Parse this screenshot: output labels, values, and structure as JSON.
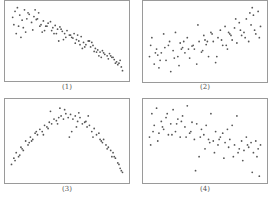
{
  "chart_data": [
    {
      "type": "scatter",
      "title": "(1)",
      "description": "Negative linear-ish correlation, points from top-left to bottom-right",
      "x": [
        0.04,
        0.06,
        0.08,
        0.1,
        0.12,
        0.14,
        0.16,
        0.18,
        0.2,
        0.22,
        0.24,
        0.26,
        0.28,
        0.3,
        0.32,
        0.34,
        0.36,
        0.38,
        0.4,
        0.42,
        0.44,
        0.46,
        0.48,
        0.5,
        0.52,
        0.54,
        0.56,
        0.58,
        0.6,
        0.62,
        0.64,
        0.66,
        0.68,
        0.7,
        0.72,
        0.74,
        0.76,
        0.78,
        0.8,
        0.82,
        0.84,
        0.86,
        0.88,
        0.9,
        0.92,
        0.94,
        0.96,
        0.05,
        0.09,
        0.13,
        0.17,
        0.21,
        0.25,
        0.29,
        0.33,
        0.37,
        0.41,
        0.45,
        0.49,
        0.53,
        0.57,
        0.61,
        0.65,
        0.69,
        0.73,
        0.77,
        0.81,
        0.85,
        0.89,
        0.93,
        0.97,
        0.07,
        0.15,
        0.23,
        0.31,
        0.39,
        0.47,
        0.55,
        0.63,
        0.71,
        0.79,
        0.87,
        0.95,
        0.11,
        0.27,
        0.43,
        0.59,
        0.75,
        0.91
      ],
      "y": [
        0.82,
        0.9,
        0.95,
        0.85,
        0.78,
        0.92,
        0.8,
        0.86,
        0.75,
        0.83,
        0.79,
        0.88,
        0.72,
        0.77,
        0.7,
        0.74,
        0.76,
        0.68,
        0.71,
        0.66,
        0.69,
        0.63,
        0.6,
        0.64,
        0.58,
        0.55,
        0.6,
        0.52,
        0.5,
        0.56,
        0.48,
        0.45,
        0.5,
        0.42,
        0.44,
        0.4,
        0.38,
        0.35,
        0.37,
        0.32,
        0.3,
        0.33,
        0.28,
        0.25,
        0.22,
        0.2,
        0.15,
        0.72,
        0.7,
        0.68,
        0.88,
        0.65,
        0.8,
        0.62,
        0.7,
        0.64,
        0.6,
        0.66,
        0.55,
        0.58,
        0.47,
        0.45,
        0.42,
        0.5,
        0.36,
        0.3,
        0.34,
        0.26,
        0.28,
        0.18,
        0.1,
        0.6,
        0.62,
        0.92,
        0.64,
        0.6,
        0.52,
        0.54,
        0.4,
        0.48,
        0.28,
        0.3,
        0.24,
        0.55,
        0.7,
        0.5,
        0.58,
        0.35,
        0.2
      ],
      "xlim": [
        0,
        1
      ],
      "ylim": [
        0,
        1
      ],
      "grid": false
    },
    {
      "type": "scatter",
      "title": "(2)",
      "description": "Weak positive correlation, widely scattered",
      "x": [
        0.03,
        0.05,
        0.07,
        0.09,
        0.11,
        0.13,
        0.15,
        0.17,
        0.19,
        0.21,
        0.23,
        0.25,
        0.27,
        0.29,
        0.31,
        0.33,
        0.35,
        0.37,
        0.39,
        0.41,
        0.43,
        0.45,
        0.47,
        0.49,
        0.51,
        0.53,
        0.55,
        0.57,
        0.59,
        0.61,
        0.63,
        0.65,
        0.67,
        0.69,
        0.71,
        0.73,
        0.75,
        0.77,
        0.79,
        0.81,
        0.83,
        0.85,
        0.87,
        0.89,
        0.91,
        0.93,
        0.95,
        0.97,
        0.04,
        0.12,
        0.2,
        0.28,
        0.36,
        0.44,
        0.52,
        0.6,
        0.68,
        0.76,
        0.84,
        0.92,
        0.08,
        0.16,
        0.24,
        0.32,
        0.4,
        0.48,
        0.56,
        0.64,
        0.72,
        0.8,
        0.88,
        0.96,
        0.1,
        0.3,
        0.5,
        0.7,
        0.9
      ],
      "y": [
        0.3,
        0.55,
        0.2,
        0.4,
        0.15,
        0.35,
        0.6,
        0.25,
        0.45,
        0.1,
        0.38,
        0.62,
        0.3,
        0.48,
        0.42,
        0.35,
        0.55,
        0.28,
        0.44,
        0.4,
        0.2,
        0.5,
        0.36,
        0.58,
        0.46,
        0.3,
        0.62,
        0.5,
        0.22,
        0.55,
        0.65,
        0.45,
        0.7,
        0.4,
        0.6,
        0.52,
        0.68,
        0.48,
        0.75,
        0.58,
        0.62,
        0.8,
        0.5,
        0.72,
        0.85,
        0.6,
        0.9,
        0.7,
        0.45,
        0.25,
        0.5,
        0.18,
        0.4,
        0.72,
        0.5,
        0.3,
        0.45,
        0.8,
        0.55,
        0.65,
        0.35,
        0.42,
        0.28,
        0.5,
        0.45,
        0.38,
        0.6,
        0.52,
        0.58,
        0.65,
        0.88,
        0.55,
        0.32,
        0.4,
        0.52,
        0.62,
        0.95
      ],
      "xlim": [
        0,
        1
      ],
      "ylim": [
        0,
        1
      ],
      "grid": false
    },
    {
      "type": "scatter",
      "title": "(3)",
      "description": "Inverted-U (quadratic) relationship",
      "x": [
        0.03,
        0.05,
        0.07,
        0.09,
        0.11,
        0.13,
        0.15,
        0.17,
        0.19,
        0.21,
        0.23,
        0.25,
        0.27,
        0.29,
        0.31,
        0.33,
        0.35,
        0.37,
        0.39,
        0.41,
        0.43,
        0.45,
        0.47,
        0.49,
        0.51,
        0.53,
        0.55,
        0.57,
        0.59,
        0.61,
        0.63,
        0.65,
        0.67,
        0.69,
        0.71,
        0.73,
        0.75,
        0.77,
        0.79,
        0.81,
        0.83,
        0.85,
        0.87,
        0.89,
        0.91,
        0.93,
        0.95,
        0.97,
        0.06,
        0.12,
        0.18,
        0.24,
        0.3,
        0.36,
        0.42,
        0.48,
        0.54,
        0.6,
        0.66,
        0.72,
        0.78,
        0.84,
        0.9,
        0.96,
        0.1,
        0.2,
        0.34,
        0.44,
        0.52,
        0.58,
        0.68,
        0.8,
        0.88,
        0.94
      ],
      "y": [
        0.2,
        0.28,
        0.35,
        0.3,
        0.42,
        0.38,
        0.5,
        0.45,
        0.55,
        0.52,
        0.6,
        0.58,
        0.65,
        0.62,
        0.7,
        0.68,
        0.74,
        0.72,
        0.78,
        0.76,
        0.8,
        0.82,
        0.78,
        0.85,
        0.8,
        0.84,
        0.78,
        0.82,
        0.75,
        0.8,
        0.72,
        0.74,
        0.68,
        0.7,
        0.62,
        0.66,
        0.58,
        0.6,
        0.5,
        0.52,
        0.45,
        0.42,
        0.38,
        0.35,
        0.28,
        0.22,
        0.15,
        0.1,
        0.25,
        0.4,
        0.48,
        0.62,
        0.58,
        0.88,
        0.72,
        0.9,
        0.62,
        0.86,
        0.75,
        0.55,
        0.52,
        0.4,
        0.3,
        0.12,
        0.32,
        0.5,
        0.66,
        0.92,
        0.55,
        0.68,
        0.82,
        0.48,
        0.3,
        0.2
      ],
      "xlim": [
        0,
        1
      ],
      "ylim": [
        0,
        1
      ],
      "grid": false
    },
    {
      "type": "scatter",
      "title": "(4)",
      "description": "Weak negative correlation, widely scattered",
      "x": [
        0.03,
        0.05,
        0.07,
        0.09,
        0.11,
        0.13,
        0.15,
        0.17,
        0.19,
        0.21,
        0.23,
        0.25,
        0.27,
        0.29,
        0.31,
        0.33,
        0.35,
        0.37,
        0.39,
        0.41,
        0.43,
        0.45,
        0.47,
        0.49,
        0.51,
        0.53,
        0.55,
        0.57,
        0.59,
        0.61,
        0.63,
        0.65,
        0.67,
        0.69,
        0.71,
        0.73,
        0.75,
        0.77,
        0.79,
        0.81,
        0.83,
        0.85,
        0.87,
        0.89,
        0.91,
        0.93,
        0.95,
        0.97,
        0.06,
        0.14,
        0.22,
        0.3,
        0.38,
        0.46,
        0.54,
        0.62,
        0.7,
        0.78,
        0.86,
        0.94,
        0.1,
        0.26,
        0.42,
        0.58,
        0.74,
        0.9,
        0.04,
        0.18,
        0.34,
        0.5,
        0.66,
        0.82,
        0.96
      ],
      "y": [
        0.55,
        0.85,
        0.7,
        0.92,
        0.6,
        0.75,
        0.65,
        0.8,
        0.58,
        0.72,
        0.9,
        0.62,
        0.78,
        0.55,
        0.82,
        0.68,
        0.95,
        0.6,
        0.74,
        0.52,
        0.72,
        0.3,
        0.65,
        0.58,
        0.7,
        0.52,
        0.85,
        0.5,
        0.62,
        0.45,
        0.55,
        0.6,
        0.48,
        0.65,
        0.52,
        0.7,
        0.45,
        0.82,
        0.4,
        0.5,
        0.38,
        0.55,
        0.42,
        0.48,
        0.35,
        0.5,
        0.4,
        0.45,
        0.62,
        0.68,
        0.58,
        0.75,
        0.62,
        0.55,
        0.48,
        0.52,
        0.42,
        0.35,
        0.45,
        0.3,
        0.5,
        0.72,
        0.12,
        0.35,
        0.3,
        0.1,
        0.45,
        0.85,
        0.55,
        0.4,
        0.28,
        0.25,
        0.05
      ],
      "xlim": [
        0,
        1
      ],
      "ylim": [
        0,
        1
      ],
      "grid": false
    }
  ],
  "panels": [
    {
      "label": "(1)"
    },
    {
      "label": "(2)"
    },
    {
      "label": "(3)"
    },
    {
      "label": "(4)"
    }
  ],
  "style": {
    "point_color": "#555555",
    "border_color": "#9a9a9a"
  }
}
